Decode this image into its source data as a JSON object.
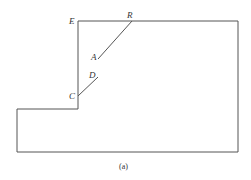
{
  "diagram": {
    "caption": "(a)",
    "labels": {
      "E": "E",
      "R": "R",
      "A": "A",
      "D": "D",
      "C": "C"
    },
    "outline_color": "#555555",
    "outline_points": [
      [
        78,
        21
      ],
      [
        238,
        21
      ],
      [
        238,
        152
      ],
      [
        17,
        152
      ],
      [
        17,
        109
      ],
      [
        78,
        109
      ]
    ],
    "segments": [
      {
        "name": "RA",
        "from": [
          132,
          21
        ],
        "to": [
          98,
          59
        ]
      },
      {
        "name": "CD",
        "from": [
          78,
          96
        ],
        "to": [
          98,
          77
        ]
      }
    ]
  }
}
